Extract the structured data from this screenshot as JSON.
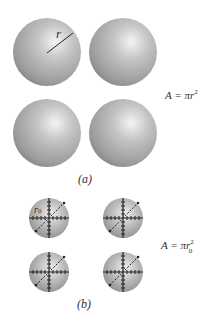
{
  "panel_a": {
    "caption": "(a)",
    "radius_label": "r",
    "equation": {
      "lhs": "A = ",
      "pi": "π",
      "var": "r",
      "exp": "2"
    },
    "spheres": 4
  },
  "panel_b": {
    "caption": "(b)",
    "radius_label": "r",
    "radius_subscript": "0",
    "equation": {
      "lhs": "A = ",
      "pi": "π",
      "var": "r",
      "exp": "2",
      "sub": "0"
    },
    "spheres": 4
  },
  "colors": {
    "sphere_highlight": "#f4f4f4",
    "sphere_mid": "#b8b8b8",
    "sphere_edge": "#7e7e7e",
    "line": "#222222"
  }
}
